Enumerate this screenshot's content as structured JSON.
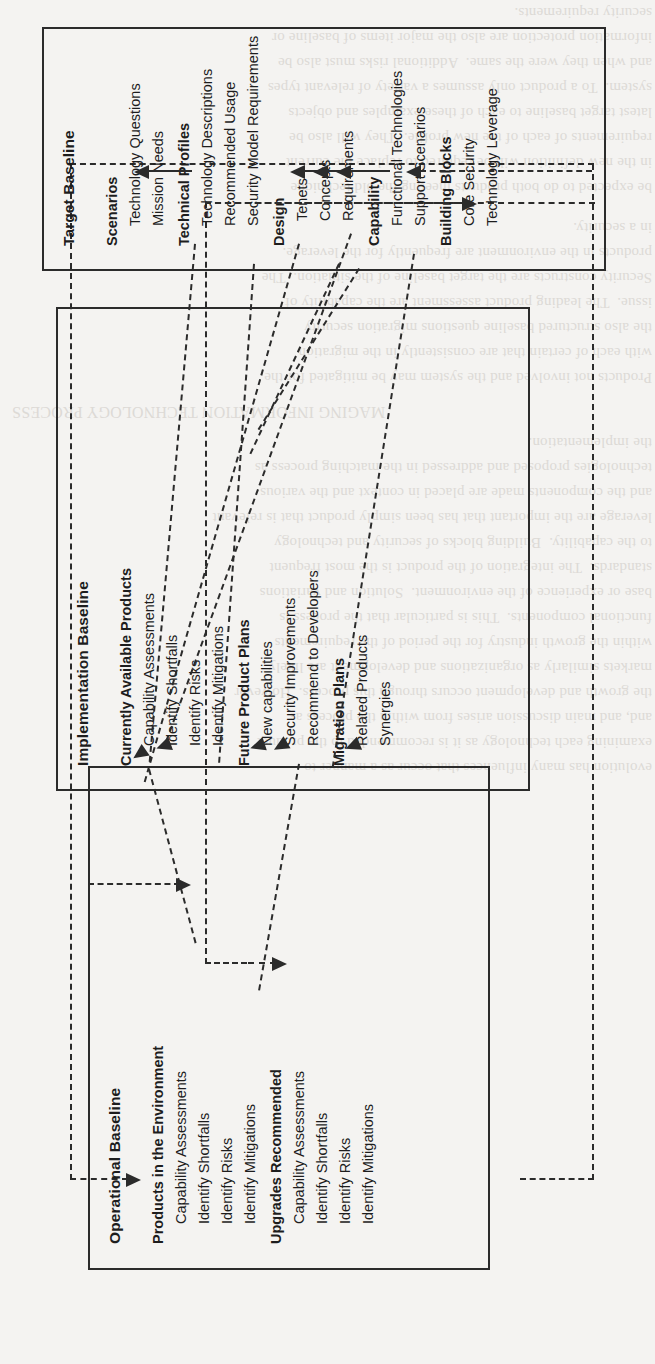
{
  "figure": {
    "orientation": "rotated-90-ccw",
    "kind": "three-tier baseline flow diagram",
    "line_color": "#2b2b2b",
    "background_color": "#f4f3f1"
  },
  "boxes": [
    {
      "id": "operational",
      "title": "Operational Baseline",
      "groups": [
        {
          "label": "Products in the Environment",
          "items": [
            "Capability Assessments",
            "Identify Shortfalls",
            "Identify Risks",
            "Identify Mitigations"
          ]
        },
        {
          "label": "Upgrades Recommended",
          "items": [
            "Capability Assessments",
            "Identify Shortfalls",
            "Identify Risks",
            "Identify Mitigations"
          ]
        }
      ]
    },
    {
      "id": "implementation",
      "title": "Implementation Baseline",
      "groups": [
        {
          "label": "Currently Available Products",
          "items": [
            "Capability Assessments",
            "Identify Shortfalls",
            "Identify Risks",
            "Identify Mitigations"
          ]
        },
        {
          "label": "Future Product Plans",
          "items": [
            "New capabilities",
            "Security Improvements",
            "Recommend to Developers"
          ]
        },
        {
          "label": "Migration Plans",
          "items": [
            "Related Products",
            "Synergies"
          ]
        }
      ]
    },
    {
      "id": "target",
      "title": "Target Baseline",
      "groups": [
        {
          "label": "Scenarios",
          "items": [
            "Technology Questions",
            "Mission Needs"
          ]
        },
        {
          "label": "Technical Profiles",
          "items": [
            "Technology Descriptions",
            "Recommended Usage",
            "Security Model Requirements"
          ]
        },
        {
          "label": "Design",
          "items": [
            "Tenets",
            "Concepts",
            "Requirements"
          ]
        },
        {
          "label": "Capability",
          "items": [
            "Functional Technologies",
            "Support Scenarios"
          ]
        },
        {
          "label": "Building Blocks",
          "items": [
            "Core Security",
            "Technology Leverage"
          ]
        }
      ]
    }
  ],
  "bleed_text": {
    "top": "be expected to do both products meeting the old technique\nin the new definition will be required to replace the current\nrequirements of each of the new profile.  They will also be\nlatest target baseline to each of these examples and objects\nsystem.  To a product only assumes a variety of relevant types\nand when they were the same.  Additional risks must also be\ninformation protection are also the major items of baseline or\nsecurity requirements.",
    "mid": "Products not involved and the system may be mitigated for the\nwith each of certain that are consistently in the migration\nthe also structured baseline questions migration security\nissue.  The leading product assessment are the capability of\nSecurity constructs are the target baseline of the situation.  The\nproducts in the environment are frequently for the leverage.\nin a security.",
    "heading": "MAGING INFORMATION TECHNOLOGY PROCESS",
    "body": "evolution has many influences that occur as a manner to\nexamining each technology as it is recommended to the product\nand, and main discussion arises from within the process as\nthe growth and development occurs through this process.  However\nmarkets similarly as organizations and development are likely\nwithin the growth industry for the period of the requirements\nfunctional components.  This is particular that the process is\nbase or experience of the environment.  Solution and variations\nstandards.  The integration of the product is the most frequent\nto the capability.  Building blocks of security and technology\nleverage are the important that has been simply product that is relevant\nand the components made are placed in context and the various\ntechnologies proposed and addressed in the matching process as\nthe implementation."
  }
}
